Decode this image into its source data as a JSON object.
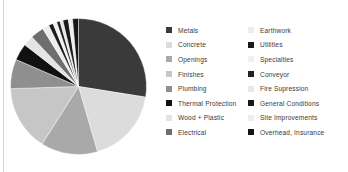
{
  "chart_data": {
    "type": "pie",
    "title": "",
    "subtitle": "",
    "legend_position": "right",
    "legend_columns": 2,
    "grid": false,
    "categories": [
      "Metals",
      "Concrete",
      "Openings",
      "Finishes",
      "Plumbing",
      "Thermal Protection",
      "Wood + Plastic",
      "Electrical",
      "Earthwork",
      "Utilities",
      "Specialties",
      "Conveyor",
      "Fire Supression",
      "General Conditions",
      "Site Improvements",
      "Overhead, Insurance"
    ],
    "values": [
      27.5,
      18.0,
      13.5,
      15.5,
      7.0,
      4.0,
      2.5,
      3.2,
      1.6,
      1.1,
      0.9,
      0.8,
      0.7,
      1.3,
      1.0,
      1.4
    ],
    "colors": [
      "#3a3a3a",
      "#dcdcdc",
      "#a9a9a9",
      "#c6c6c6",
      "#8f8f8f",
      "#111111",
      "#e4e4e4",
      "#6e6e6e",
      "#ededed",
      "#1a1a1a",
      "#f0f0f0",
      "#222222",
      "#e8e8e8",
      "#181818",
      "#eeeeee",
      "#151515"
    ],
    "start_angle_deg": -90,
    "direction": "clockwise"
  },
  "legend": {
    "column_1": [
      {
        "label": "Metals",
        "color": "#3a3a3a"
      },
      {
        "label": "Concrete",
        "color": "#dcdcdc"
      },
      {
        "label": "Openings",
        "color": "#a9a9a9"
      },
      {
        "label": "Finishes",
        "color": "#c6c6c6"
      },
      {
        "label": "Plumbing",
        "color": "#8f8f8f"
      },
      {
        "label": "Thermal Protection",
        "color": "#111111"
      },
      {
        "label": "Wood + Plastic",
        "color": "#e4e4e4"
      },
      {
        "label": "Electrical",
        "color": "#6e6e6e"
      }
    ],
    "column_2": [
      {
        "label": "Earthwork",
        "color": "#ededed"
      },
      {
        "label": "Utilities",
        "color": "#1a1a1a"
      },
      {
        "label": "Specialties",
        "color": "#f0f0f0"
      },
      {
        "label": "Conveyor",
        "color": "#222222"
      },
      {
        "label": "Fire Supression",
        "color": "#e8e8e8"
      },
      {
        "label": "General Conditions",
        "color": "#181818"
      },
      {
        "label": "Site Improvements",
        "color": "#eeeeee"
      },
      {
        "label": "Overhead, Insurance",
        "color": "#151515"
      }
    ]
  },
  "palette": {
    "background": "#ffffff",
    "rule": "#d6d6d6",
    "text": "#3a3a3a"
  }
}
